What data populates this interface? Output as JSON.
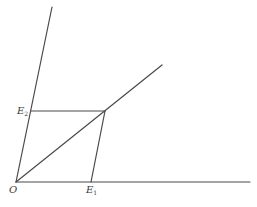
{
  "diagram": {
    "type": "vector-parallelogram-decomposition",
    "stroke_color": "#4a4a4a",
    "background": "#ffffff",
    "points": {
      "O": {
        "x": 16,
        "y": 182
      },
      "E1": {
        "x": 91,
        "y": 182
      },
      "E2": {
        "x": 31,
        "y": 111
      },
      "P": {
        "x": 105,
        "y": 111
      }
    },
    "lines": [
      {
        "name": "axis-1",
        "from": [
          16,
          182
        ],
        "to": [
          250,
          182
        ]
      },
      {
        "name": "axis-2",
        "from": [
          16,
          182
        ],
        "to": [
          52,
          7
        ]
      },
      {
        "name": "diagonal",
        "from": [
          16,
          182
        ],
        "to": [
          162,
          65
        ]
      },
      {
        "name": "parallel-to-axis-1",
        "from": [
          31,
          111
        ],
        "to": [
          105,
          111
        ]
      },
      {
        "name": "parallel-to-axis-2",
        "from": [
          91,
          182
        ],
        "to": [
          105,
          111
        ]
      }
    ],
    "labels": {
      "origin": {
        "main": "O",
        "sub": ""
      },
      "e1": {
        "main": "E",
        "sub": "1"
      },
      "e2": {
        "main": "E",
        "sub": "2"
      }
    }
  }
}
